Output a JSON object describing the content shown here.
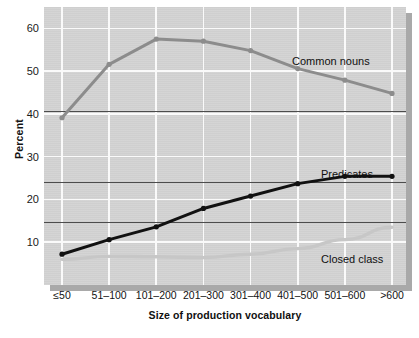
{
  "figure": {
    "background_color": "#ffffff",
    "panel_color": "#d3d3d3",
    "gridline_color": "#fafafa",
    "reference_line_color": "#4c4c4c",
    "shadow_color": "#a9a9a9"
  },
  "chart_data": {
    "type": "line",
    "title": "",
    "subtitle": "",
    "xlabel": "Size of production vocabulary",
    "ylabel": "Percent",
    "categories": [
      "≤50",
      "51–100",
      "101–200",
      "201–300",
      "301–400",
      "401–500",
      "501–600",
      ">600"
    ],
    "xlim": [
      0,
      7
    ],
    "ylim": [
      0,
      65
    ],
    "yticks": [
      10,
      20,
      30,
      40,
      50,
      60
    ],
    "ytick_labels": [
      "10",
      "20",
      "30",
      "40",
      "50",
      "60"
    ],
    "grid": true,
    "grid_axis": "both",
    "legend_position": "inline-annotations",
    "reference_lines": [
      {
        "name": "common-nouns-reference",
        "value": 40.8,
        "color": "#4c4c4c"
      },
      {
        "name": "predicates-reference",
        "value": 24.1,
        "color": "#4c4c4c"
      },
      {
        "name": "closed-class-reference",
        "value": 14.7,
        "color": "#4c4c4c"
      }
    ],
    "series": [
      {
        "name": "Common nouns",
        "color": "#8c8c8c",
        "marker": "circle",
        "values": [
          39.1,
          51.6,
          57.5,
          57.0,
          54.8,
          50.6,
          47.9,
          44.8
        ]
      },
      {
        "name": "Predicates",
        "color": "#111111",
        "marker": "circle",
        "values": [
          7.2,
          10.6,
          13.6,
          17.9,
          20.8,
          23.7,
          25.4,
          25.4
        ]
      },
      {
        "name": "Closed class",
        "color": "#c7c7c7",
        "marker": "none",
        "values": [
          6.0,
          6.7,
          6.6,
          6.4,
          7.2,
          8.5,
          10.6,
          13.5
        ]
      }
    ],
    "annotations": [
      {
        "name": "common-nouns-label",
        "text": "Common nouns",
        "series": "Common nouns"
      },
      {
        "name": "predicates-label",
        "text": "Predicates",
        "series": "Predicates"
      },
      {
        "name": "closed-class-label",
        "text": "Closed class",
        "series": "Closed class"
      }
    ]
  }
}
